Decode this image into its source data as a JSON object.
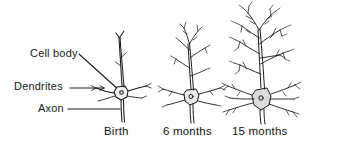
{
  "figure": {
    "background_color": "#ffffff",
    "ink_color": "#1a1a1a"
  },
  "annotations": {
    "cell_body": "Cell body",
    "dendrites": "Dendrites",
    "axon": "Axon"
  },
  "captions": {
    "birth": "Birth",
    "six_months": "6 months",
    "fifteen_months": "15 months"
  },
  "panels": [
    {
      "id": "birth",
      "caption": "Birth",
      "description": "Newborn cortical neuron with sparse, short dendritic branches",
      "soma_center": [
        122,
        93
      ],
      "branch_extent_top": 33
    },
    {
      "id": "six-months",
      "caption": "6 months",
      "description": "Six-month cortical neuron with moderately branched dendritic arbor",
      "soma_center": [
        192,
        97
      ],
      "branch_extent_top": 25
    },
    {
      "id": "fifteen-months",
      "caption": "15 months",
      "description": "Fifteen-month cortical neuron with dense, highly branched dendritic arbor",
      "soma_center": [
        262,
        100
      ],
      "branch_extent_top": 8
    }
  ]
}
